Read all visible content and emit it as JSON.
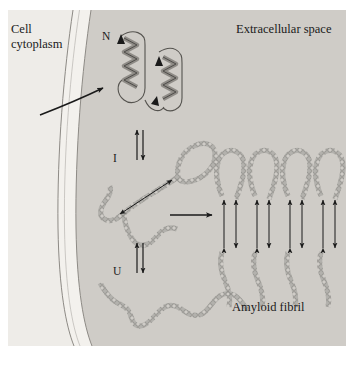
{
  "figure": {
    "panel": {
      "x": 8,
      "y": 10,
      "width": 338,
      "height": 336,
      "cytoplasm_color": "#eceae6",
      "membrane_color": "#f4f2ee",
      "extracellular_color": "#cfccc7"
    },
    "labels": {
      "cytoplasm_line1": "Cell",
      "cytoplasm_line2": "cytoplasm",
      "extracellular": "Extracellular space",
      "amyloid_fibril": "Amyloid fibril",
      "native_state": "N",
      "intermediate_state": "I",
      "unfolded_state": "U"
    },
    "states": [
      {
        "id": "native",
        "symbol": "N",
        "description": "Native folded protein with two alpha helices"
      },
      {
        "id": "intermediate",
        "symbol": "I",
        "description": "Partially folded intermediate with beta hairpin"
      },
      {
        "id": "unfolded",
        "symbol": "U",
        "description": "Unfolded random coil polypeptide chain"
      }
    ],
    "fibril": {
      "strand_count": 4,
      "description": "Stacked beta strands forming amyloid fibril"
    },
    "arrows": {
      "import_arrow": "curved arrow crossing membrane into extracellular space",
      "equilibrium_upper": "reversible equilibrium between N and I",
      "equilibrium_lower": "reversible equilibrium between I and U",
      "aggregation_arrow": "irreversible arrow from I to amyloid fibril"
    },
    "colors": {
      "ink": "#1a1a1a",
      "chain": "#9a9a9a",
      "chain_outline": "#6e6e6e"
    }
  }
}
